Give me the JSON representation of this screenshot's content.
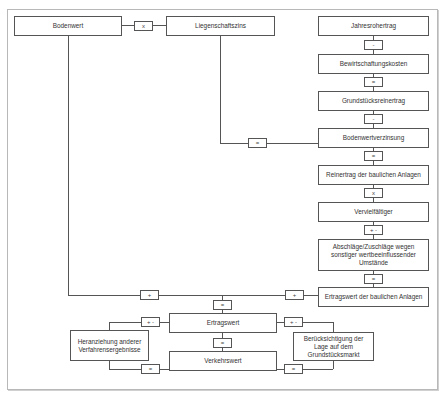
{
  "diagram": {
    "nodes": {
      "bodenwert": "Bodenwert",
      "liegenschaftszins": "Liegenschaftszins",
      "jahresrohertrag": "Jahresrohertrag",
      "bewirtschaftungskosten": "Bewirtschaftungskosten",
      "grundstuecksreinertrag": "Grundstücksreinertrag",
      "bodenwertverzinsung": "Bodenwertverzinsung",
      "reinertrag": "Reinertrag der baulichen Anlagen",
      "vervielfaeltiger": "Vervielfältiger",
      "abschlaege": "Abschläge/Zuschläge wegen sonstiger wertbeeinflussender Umstände",
      "ertragswert_bauliche": "Ertragswert der baulichen Anlagen",
      "ertragswert": "Ertragswert",
      "verkehrswert": "Verkehrswert",
      "heranziehung": "Heranziehung anderer Verfahrensergebnisse",
      "beruecksichtigung": "Berücksichtigung der Lage auf dem Grundstücksmarkt"
    },
    "operators": {
      "bodenwert_x_zins": "x",
      "rohertrag_minus": "-",
      "bewirtschaftung_eq": "=",
      "reinertrag_minus": "-",
      "zins_eq": "=",
      "verzinsung_eq": "=",
      "reinertrag_x": "x",
      "vervielfaeltiger_pm": "+ -",
      "abschlaege_eq": "=",
      "bodenwert_plus": "+",
      "bauliche_plus": "+",
      "ertragswert_eq_top": "=",
      "heranziehung_pm": "+ -",
      "heranziehung_eq": "=",
      "lage_pm": "+ -",
      "lage_eq": "=",
      "verkehrswert_eq": "="
    }
  }
}
